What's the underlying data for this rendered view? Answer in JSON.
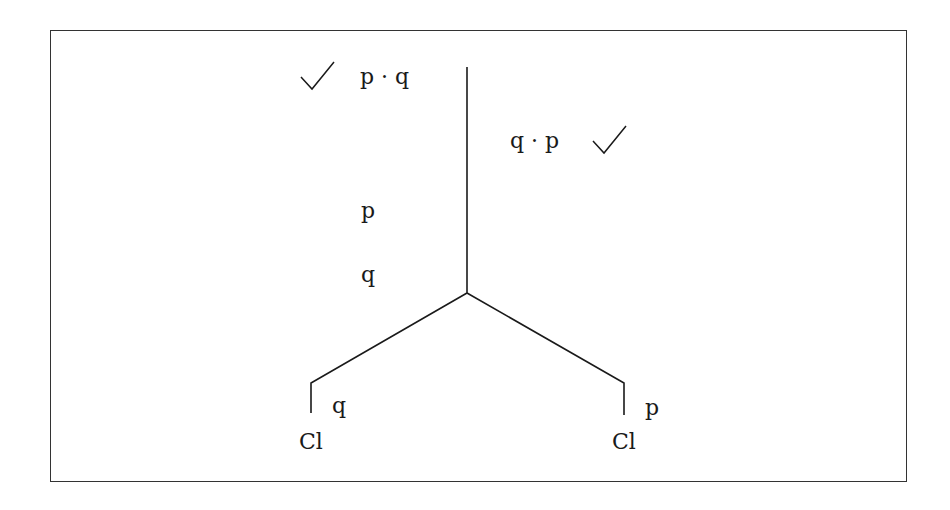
{
  "diagram": {
    "type": "truth-tree",
    "colors": {
      "line": "#1a1a1a",
      "frame": "#333333",
      "background": "#ffffff"
    },
    "trunk": {
      "lines": [
        {
          "id": "line-1",
          "text": "p · q",
          "checked": true
        },
        {
          "id": "line-2",
          "text": "q · p",
          "checked": true,
          "side": "right"
        },
        {
          "id": "line-3",
          "text": "p"
        },
        {
          "id": "line-4",
          "text": "q"
        }
      ]
    },
    "branches": [
      {
        "id": "left",
        "text": "q",
        "closure": "Cl"
      },
      {
        "id": "right",
        "text": "p",
        "closure": "Cl"
      }
    ]
  }
}
